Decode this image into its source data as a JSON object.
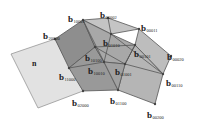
{
  "diagram": {
    "type": "bezier-control-net",
    "normal_plane_label": "n",
    "colors": {
      "plane_fill": "#e2e2e2",
      "plane_stroke": "#8a8a8a",
      "face_dark": "#8e8e8e",
      "face_mid": "#a9a9a9",
      "face_light": "#c8c8c8",
      "edge": "#555555",
      "point": "#444444"
    },
    "points": [
      {
        "id": "b10001",
        "base": "b",
        "sub": "10001",
        "x": 83,
        "y": 20
      },
      {
        "id": "b00002",
        "base": "b",
        "sub": "00002",
        "x": 108,
        "y": 18
      },
      {
        "id": "b00011",
        "base": "b",
        "sub": "00011",
        "x": 139,
        "y": 29
      },
      {
        "id": "b20000",
        "base": "b",
        "sub": "20000",
        "x": 55,
        "y": 39
      },
      {
        "id": "b01010",
        "base": "b",
        "sub": "01010",
        "x": 111,
        "y": 34
      },
      {
        "id": "b00101",
        "base": "b",
        "sub": "00101",
        "x": 135,
        "y": 45
      },
      {
        "id": "b00020",
        "base": "b",
        "sub": "00020",
        "x": 171,
        "y": 56
      },
      {
        "id": "b10100",
        "base": "b",
        "sub": "10100",
        "x": 95,
        "y": 47
      },
      {
        "id": "b10010",
        "base": "b",
        "sub": "10010",
        "x": 104,
        "y": 62
      },
      {
        "id": "b01001",
        "base": "b",
        "sub": "01001",
        "x": 125,
        "y": 64
      },
      {
        "id": "b11000",
        "base": "b",
        "sub": "11000",
        "x": 69,
        "y": 68
      },
      {
        "id": "b00110",
        "base": "b",
        "sub": "00110",
        "x": 163,
        "y": 74
      },
      {
        "id": "b02000",
        "base": "b",
        "sub": "02000",
        "x": 83,
        "y": 91
      },
      {
        "id": "b01100",
        "base": "b",
        "sub": "01100",
        "x": 118,
        "y": 90
      },
      {
        "id": "b00200",
        "base": "b",
        "sub": "00200",
        "x": 155,
        "y": 104
      }
    ]
  }
}
